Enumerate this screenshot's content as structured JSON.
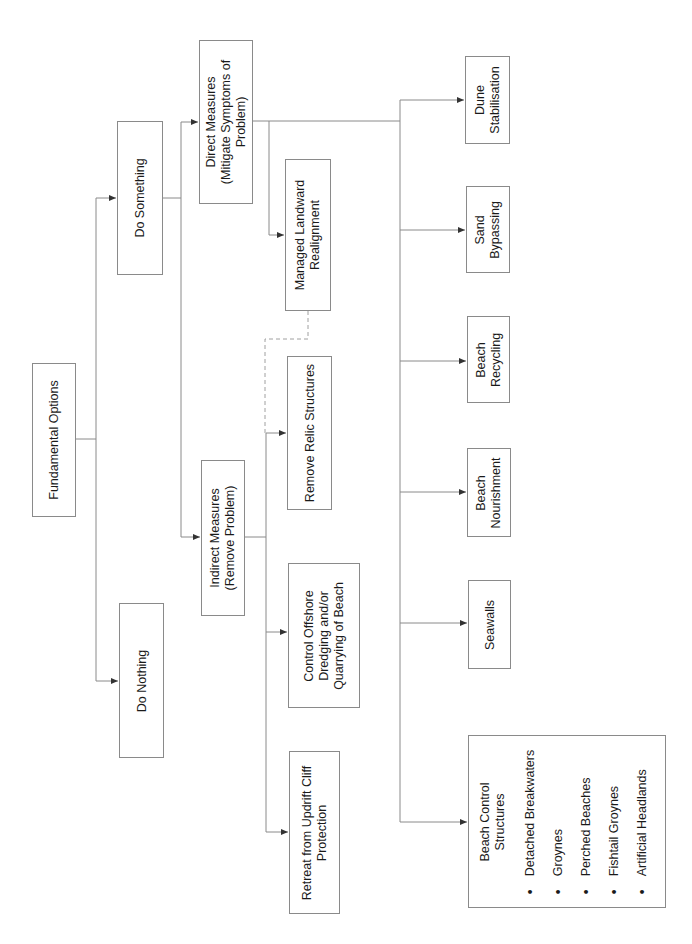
{
  "diagram": {
    "root": {
      "label": "Fundamental Options"
    },
    "level1": {
      "do_something": {
        "label": "Do Something"
      },
      "do_nothing": {
        "label": "Do Nothing"
      }
    },
    "level2": {
      "direct": {
        "line1": "Direct Measures",
        "line2": "(Mitigate Symptoms of",
        "line3": "Problem)"
      },
      "indirect": {
        "line1": "Indirect Measures",
        "line2": "(Remove Problem)"
      }
    },
    "indirect_children": {
      "managed": {
        "line1": "Managed Landward",
        "line2": "Realignment"
      },
      "relic": {
        "line1": "Remove Relic Structures"
      },
      "dredging": {
        "line1": "Control Offshore",
        "line2": "Dredging and/or",
        "line3": "Quarrying of Beach"
      },
      "retreat": {
        "line1": "Retreat from Updrift Cliff",
        "line2": "Protection"
      }
    },
    "direct_children": {
      "dune": {
        "line1": "Dune",
        "line2": "Stabilisation"
      },
      "sand": {
        "line1": "Sand",
        "line2": "Bypassing"
      },
      "recycling": {
        "line1": "Beach",
        "line2": "Recycling"
      },
      "nourishment": {
        "line1": "Beach",
        "line2": "Nourishment"
      },
      "seawalls": {
        "line1": "Seawalls"
      },
      "beach_control": {
        "title1": "Beach Control",
        "title2": "Structures",
        "bullet": "•",
        "items": [
          "Detached Breakwaters",
          "Groynes",
          "Perched Beaches",
          "Fishtail Groynes",
          "Artificial Headlands"
        ]
      }
    },
    "colors": {
      "line": "#8a8a8a",
      "arrow": "#333333",
      "dashed": "#a0a0a0"
    }
  }
}
